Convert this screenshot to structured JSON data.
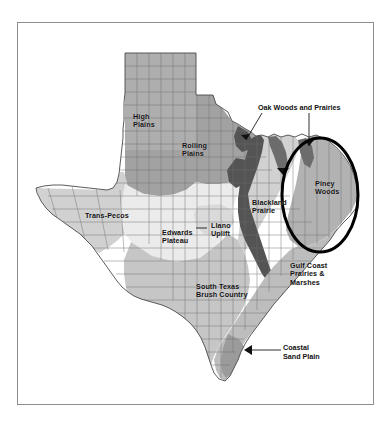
{
  "figure": {
    "frame_border_color": "#8d8d8d",
    "background_color": "#ffffff"
  },
  "highlight": {
    "shape": "ellipse",
    "color": "#000000",
    "target_region": "Piney Woods",
    "center_x": 320,
    "center_y": 195,
    "radius_x": 38,
    "radius_y": 57,
    "stroke_width": 3
  },
  "palette": {
    "plains_gray": "#a8a8a8",
    "rolling_plains_gray": "#a5a5a5",
    "trans_pecos_gray": "#d0d0d0",
    "edwards_plateau_light": "#e9e9e9",
    "llano_uplift": "#dcdcdc",
    "south_texas_gray": "#c4c4c4",
    "blackland_dark": "#5a5a5a",
    "oak_woods_gray": "#cfcfcf",
    "piney_woods_gray": "#b0b0b0",
    "gulf_coast_gray": "#bcbcbc",
    "coastal_sand_gray": "#9a9a9a",
    "county_line": "#6f6f6f",
    "state_outline": "#4a4a4a",
    "label_text": "#111111"
  },
  "regions": [
    {
      "id": "high-plains",
      "name": "High Plains",
      "label": "High\nPlains",
      "label_x": 133,
      "label_y": 113,
      "fill": "#a8a8a8"
    },
    {
      "id": "rolling-plains",
      "name": "Rolling Plains",
      "label": "Rolling\nPlains",
      "label_x": 182,
      "label_y": 142,
      "fill": "#a5a5a5"
    },
    {
      "id": "trans-pecos",
      "name": "Trans-Pecos",
      "label": "Trans-Pecos",
      "label_x": 85,
      "label_y": 212,
      "fill": "#d0d0d0"
    },
    {
      "id": "edwards-plateau",
      "name": "Edwards Plateau",
      "label": "Edwards\nPlateau",
      "label_x": 162,
      "label_y": 229,
      "fill": "#e9e9e9"
    },
    {
      "id": "llano-uplift",
      "name": "Llano Uplift",
      "label": "Llano\nUplift",
      "label_x": 211,
      "label_y": 222,
      "fill": "#dcdcdc"
    },
    {
      "id": "south-texas-brush-country",
      "name": "South Texas Brush Country",
      "label": "South Texas\nBrush Country",
      "label_x": 196,
      "label_y": 283,
      "fill": "#c4c4c4"
    },
    {
      "id": "blackland-prairie",
      "name": "Blackland Prairie",
      "label": "Blackland\nPrairie",
      "label_x": 252,
      "label_y": 199,
      "fill": "#5a5a5a"
    },
    {
      "id": "piney-woods",
      "name": "Piney Woods",
      "label": "Piney\nWoods",
      "label_x": 315,
      "label_y": 180,
      "fill": "#b0b0b0"
    },
    {
      "id": "gulf-coast-prairies-and-marshes",
      "name": "Gulf Coast Prairies & Marshes",
      "label": "Gulf Coast\nPrairies &\nMarshes",
      "label_x": 290,
      "label_y": 262,
      "fill": "#bcbcbc"
    }
  ],
  "callouts": [
    {
      "id": "oak-woods-and-prairies",
      "label": "Oak Woods and Prairies",
      "label_x": 258,
      "label_y": 110,
      "leader_lines": 2
    },
    {
      "id": "coastal-sand-plain",
      "label": "Coastal\nSand Plain",
      "label_x": 283,
      "label_y": 345,
      "leader_lines": 1
    }
  ]
}
